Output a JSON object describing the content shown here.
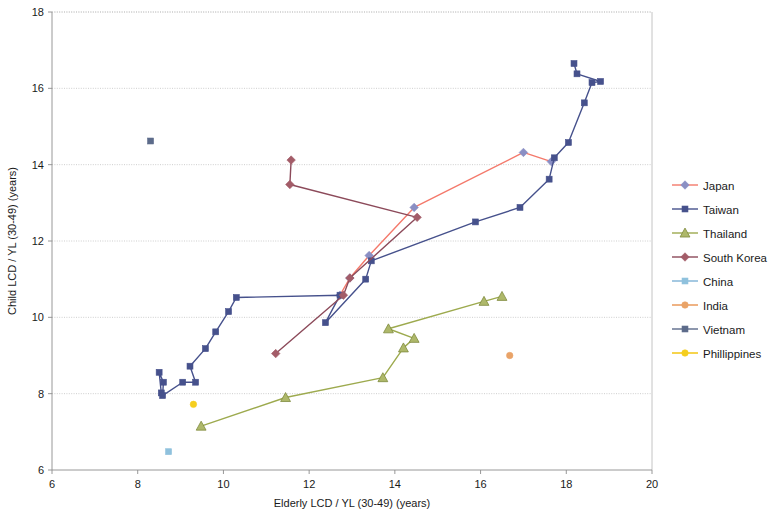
{
  "chart_data": {
    "type": "scatter",
    "title": "",
    "xlabel": "Elderly LCD / YL (30-49) (years)",
    "ylabel": "Child LCD / YL (30-49) (years)",
    "xlim": [
      6,
      20
    ],
    "ylim": [
      6,
      18
    ],
    "xticks": [
      6,
      8,
      10,
      12,
      14,
      16,
      18,
      20
    ],
    "yticks": [
      6,
      8,
      10,
      12,
      14,
      16,
      18
    ],
    "grid": "horizontal",
    "legend_position": "right",
    "series": [
      {
        "name": "Japan",
        "color": "#F4796B",
        "marker": "diamond",
        "marker_color": "#8A8FC4",
        "connected": true,
        "points": [
          [
            12.72,
            10.58
          ],
          [
            12.95,
            11.03
          ],
          [
            13.4,
            11.62
          ],
          [
            14.45,
            12.88
          ],
          [
            17.0,
            14.32
          ],
          [
            17.65,
            14.08
          ]
        ]
      },
      {
        "name": "Taiwan",
        "color": "#46518C",
        "marker": "square",
        "marker_color": "#46518C",
        "connected": true,
        "points": [
          [
            8.55,
            8.02
          ],
          [
            8.5,
            8.56
          ],
          [
            8.6,
            8.3
          ],
          [
            8.58,
            7.95
          ],
          [
            9.05,
            8.3
          ],
          [
            9.35,
            8.3
          ],
          [
            9.22,
            8.72
          ],
          [
            9.58,
            9.18
          ],
          [
            9.82,
            9.62
          ],
          [
            10.12,
            10.15
          ],
          [
            10.3,
            10.52
          ],
          [
            12.72,
            10.58
          ],
          [
            12.38,
            9.86
          ],
          [
            13.32,
            11.0
          ],
          [
            13.45,
            11.48
          ],
          [
            15.88,
            12.5
          ],
          [
            16.92,
            12.88
          ],
          [
            17.6,
            13.62
          ],
          [
            17.72,
            14.18
          ],
          [
            18.05,
            14.58
          ],
          [
            18.42,
            15.62
          ],
          [
            18.6,
            16.15
          ],
          [
            18.8,
            16.18
          ],
          [
            18.25,
            16.38
          ],
          [
            18.18,
            16.65
          ]
        ]
      },
      {
        "name": "Thailand",
        "color": "#9DAA4E",
        "marker": "triangle",
        "marker_color": "#AEB86A",
        "connected": true,
        "points": [
          [
            9.48,
            7.15
          ],
          [
            11.45,
            7.9
          ],
          [
            13.72,
            8.42
          ],
          [
            14.2,
            9.2
          ],
          [
            14.45,
            9.45
          ],
          [
            13.85,
            9.7
          ],
          [
            16.08,
            10.42
          ],
          [
            16.5,
            10.55
          ]
        ]
      },
      {
        "name": "South Korea",
        "color": "#8C4A5A",
        "marker": "diamond",
        "marker_color": "#A35C68",
        "connected": true,
        "points": [
          [
            11.22,
            9.05
          ],
          [
            12.8,
            10.58
          ],
          [
            12.95,
            11.03
          ],
          [
            14.52,
            12.62
          ],
          [
            11.55,
            13.48
          ],
          [
            11.58,
            14.12
          ]
        ]
      },
      {
        "name": "China",
        "color": "#7FB2D6",
        "marker": "square",
        "marker_color": "#8FC1DD",
        "connected": false,
        "points": [
          [
            8.72,
            6.48
          ]
        ]
      },
      {
        "name": "India",
        "color": "#E8934F",
        "marker": "circle",
        "marker_color": "#E9A368",
        "connected": false,
        "points": [
          [
            16.68,
            9.0
          ]
        ]
      },
      {
        "name": "Vietnam",
        "color": "#5C6B8A",
        "marker": "square",
        "marker_color": "#5C6B8A",
        "connected": false,
        "points": [
          [
            8.3,
            14.62
          ]
        ]
      },
      {
        "name": "Phillippines",
        "color": "#F2C200",
        "marker": "circle",
        "marker_color": "#F5CE1E",
        "connected": false,
        "points": [
          [
            9.3,
            7.72
          ]
        ]
      }
    ]
  },
  "legend": {
    "items": [
      {
        "label": "Japan"
      },
      {
        "label": "Taiwan"
      },
      {
        "label": "Thailand"
      },
      {
        "label": "South Korea"
      },
      {
        "label": "China"
      },
      {
        "label": "India"
      },
      {
        "label": "Vietnam"
      },
      {
        "label": "Phillippines"
      }
    ]
  }
}
